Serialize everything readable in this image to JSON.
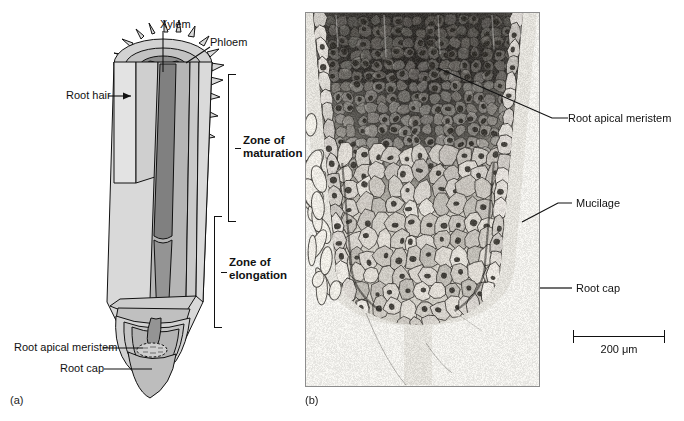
{
  "figure": {
    "panel_a_id": "(a)",
    "panel_b_id": "(b)"
  },
  "panel_a": {
    "type": "cutaway-diagram-of-root-tip",
    "labels": {
      "xylem": "Xylem",
      "phloem": "Phloem",
      "root_hair": "Root hair",
      "root_apical_meristem": "Root apical meristem",
      "root_cap": "Root cap"
    },
    "zones": [
      {
        "line1": "Zone of",
        "line2": "maturation"
      },
      {
        "line1": "Zone of",
        "line2": "elongation"
      }
    ]
  },
  "panel_b": {
    "type": "light-micrograph-of-root-tip-longitudinal-section",
    "labels": {
      "root_apical_meristem": "Root apical meristem",
      "mucilage": "Mucilage",
      "root_cap": "Root cap"
    },
    "scale_bar": {
      "value": "200",
      "unit": "μm",
      "text": "200 μm"
    }
  },
  "colors": {
    "ink": "#111111",
    "epidermis_light": "#d7d7d7",
    "cortex_mid": "#b8b8b8",
    "stele_dark": "#8e8e8e",
    "core_darkest": "#787878",
    "photo_frame": "#8d8d8d",
    "page_background": "#ffffff"
  }
}
